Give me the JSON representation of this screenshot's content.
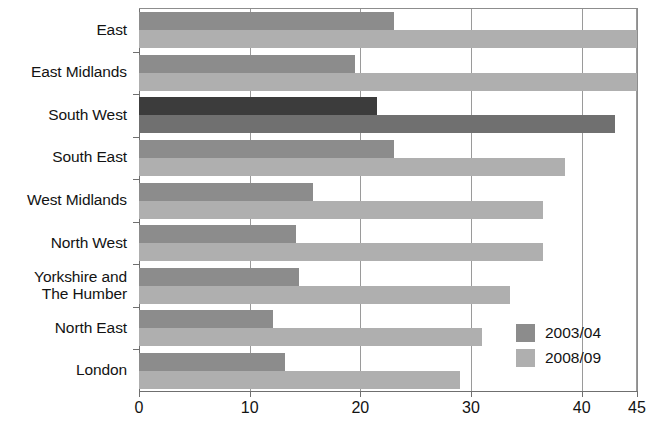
{
  "chart_data": {
    "type": "bar",
    "orientation": "horizontal",
    "title": "",
    "subtitle": "",
    "xlabel": "",
    "ylabel": "",
    "xlim": [
      0,
      45
    ],
    "grid": true,
    "legend_position": "bottom-right-inside",
    "xticks": [
      "0",
      "10",
      "20",
      "30",
      "40",
      "45"
    ],
    "xtick_values": [
      0,
      10,
      20,
      30,
      40,
      45
    ],
    "categories": [
      "East",
      "East Midlands",
      "South West",
      "South East",
      "West Midlands",
      "North West",
      "Yorkshire and The Humber",
      "North East",
      "London"
    ],
    "category_lines": [
      [
        "East"
      ],
      [
        "East Midlands"
      ],
      [
        "South West"
      ],
      [
        "South East"
      ],
      [
        "West Midlands"
      ],
      [
        "North West"
      ],
      [
        "Yorkshire and",
        "The Humber"
      ],
      [
        "North East"
      ],
      [
        "London"
      ]
    ],
    "series": [
      {
        "name": "2003/04",
        "color": "#8c8c8c",
        "highlight_color": "#3c3c3c",
        "values": [
          23.0,
          19.5,
          21.5,
          23.0,
          15.7,
          14.2,
          14.5,
          12.1,
          13.2
        ]
      },
      {
        "name": "2008/09",
        "color": "#afafaf",
        "highlight_color": "#707070",
        "values": [
          45.0,
          45.0,
          43.0,
          38.5,
          36.5,
          36.5,
          33.5,
          31.0,
          29.0
        ]
      }
    ],
    "highlighted_category": "South West",
    "colors": {
      "axis": "#6f6f6f",
      "gridline": "#9a9a9a",
      "text": "#131313",
      "background": "#ffffff"
    }
  },
  "legend": {
    "entries": [
      {
        "label": "2003/04",
        "color": "#8c8c8c"
      },
      {
        "label": "2008/09",
        "color": "#afafaf"
      }
    ]
  }
}
